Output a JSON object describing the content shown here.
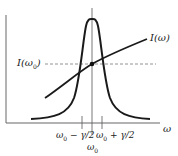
{
  "diagram": {
    "type": "resonance-curve",
    "colors": {
      "curve": "#1a1a1a",
      "axis": "#555555",
      "dashed": "#777777"
    },
    "labels": {
      "intensity_curve": "I(ω)",
      "intensity_at_center_main": "I(ω",
      "intensity_at_center_sub": "0",
      "intensity_at_center_close": ")",
      "x_axis": "ω",
      "left_half_width_main": "ω",
      "left_half_width_sub": "0",
      "left_half_width_rest": " − γ/2",
      "right_half_width_main": "ω",
      "right_half_width_sub": "0",
      "right_half_width_rest": " + γ/2",
      "center_main": "ω",
      "center_sub": "0"
    }
  }
}
